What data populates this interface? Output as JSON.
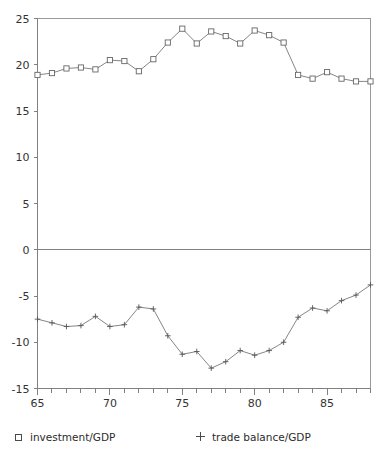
{
  "chart_data": {
    "type": "line",
    "title": "",
    "subtitle": "",
    "xlabel": "",
    "ylabel": "",
    "xlim": [
      65,
      88
    ],
    "ylim": [
      -15,
      25
    ],
    "grid": false,
    "legend_position": "bottom",
    "x_ticks_major": [
      "65",
      "70",
      "75",
      "80",
      "85"
    ],
    "x_ticks_major_values": [
      65,
      70,
      75,
      80,
      85
    ],
    "x_ticks_minor_step": 1,
    "y_ticks": [
      "25",
      "20",
      "15",
      "10",
      "5",
      "0",
      "-5",
      "-10",
      "-15"
    ],
    "y_tick_values": [
      25,
      20,
      15,
      10,
      5,
      0,
      -5,
      -10,
      -15
    ],
    "zero_line": 0,
    "x": [
      65,
      66,
      67,
      68,
      69,
      70,
      71,
      72,
      73,
      74,
      75,
      76,
      77,
      78,
      79,
      80,
      81,
      82,
      83,
      84,
      85,
      86,
      87,
      88
    ],
    "series": [
      {
        "name": "investment/GDP",
        "marker": "square",
        "values": [
          18.9,
          19.1,
          19.6,
          19.7,
          19.5,
          20.5,
          20.4,
          19.3,
          20.6,
          22.4,
          23.9,
          22.3,
          23.6,
          23.1,
          22.3,
          23.7,
          23.2,
          22.4,
          18.9,
          18.5,
          19.2,
          18.5,
          18.2,
          18.2
        ]
      },
      {
        "name": "trade balance/GDP",
        "marker": "plus",
        "values": [
          -7.5,
          -7.9,
          -8.3,
          -8.2,
          -7.2,
          -8.3,
          -8.1,
          -6.2,
          -6.4,
          -9.3,
          -11.3,
          -11.0,
          -12.8,
          -12.1,
          -10.9,
          -11.4,
          -10.9,
          -10.0,
          -7.3,
          -6.3,
          -6.6,
          -5.5,
          -4.9,
          -3.8
        ]
      }
    ]
  },
  "legend": {
    "entries": [
      {
        "symbol": "square",
        "label": "investment/GDP"
      },
      {
        "symbol": "plus",
        "label": "trade balance/GDP"
      }
    ]
  }
}
